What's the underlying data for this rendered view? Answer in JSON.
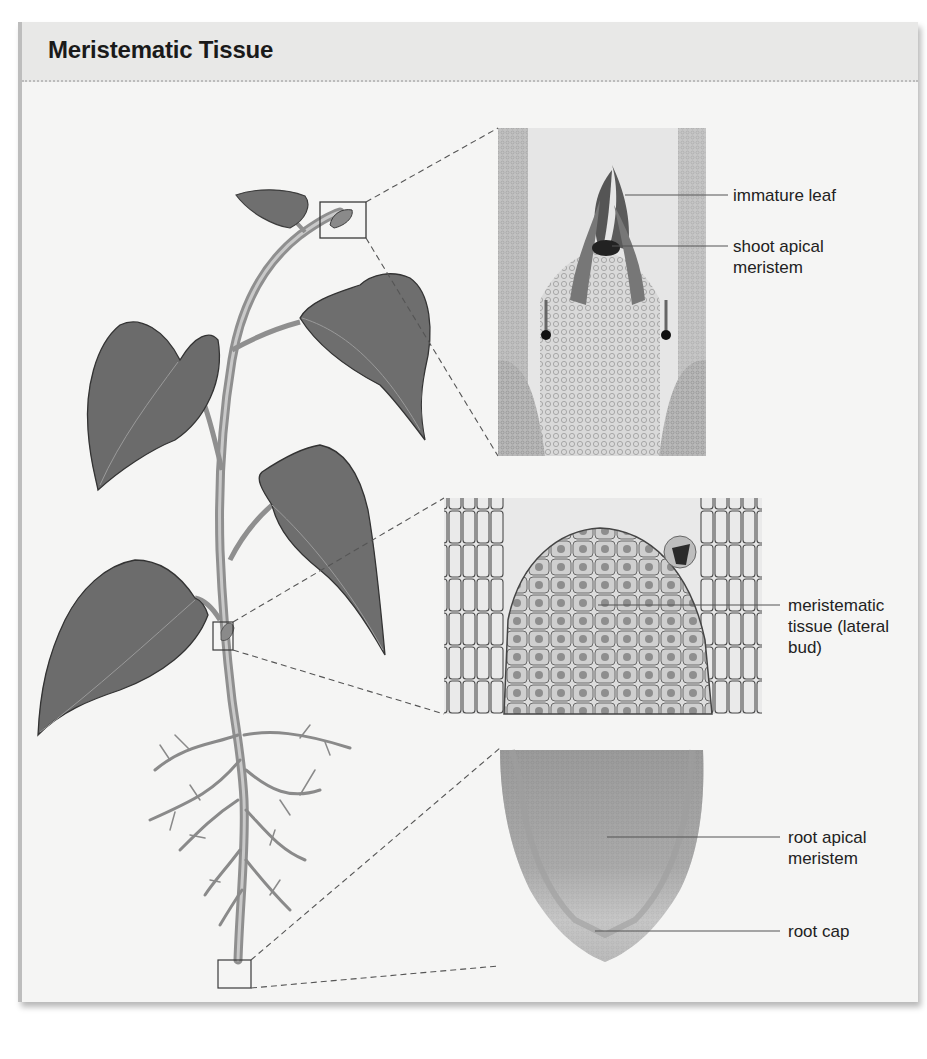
{
  "title": "Meristematic Tissue",
  "labels": {
    "immature_leaf": "immature leaf",
    "shoot_apical_meristem": "shoot apical\nmeristem",
    "lateral_bud": "meristematic\ntissue (lateral\nbud)",
    "root_apical_meristem": "root apical\nmeristem",
    "root_cap": "root cap"
  },
  "panels": [
    {
      "name": "shoot-tip-micrograph",
      "region": "shoot apex"
    },
    {
      "name": "lateral-bud-micrograph",
      "region": "lateral bud"
    },
    {
      "name": "root-tip-micrograph",
      "region": "root tip"
    }
  ],
  "colors": {
    "title_bar": "#e8e8e7",
    "card": "#f5f5f4",
    "leaf": "#6e6e6e",
    "stem": "#9a9a9a",
    "line": "#555555"
  }
}
